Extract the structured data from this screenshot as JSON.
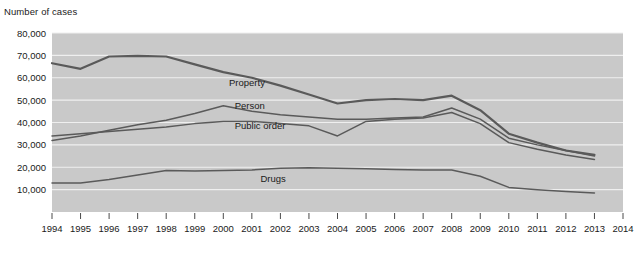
{
  "chart_data": {
    "type": "line",
    "title": "Number of cases",
    "xlabel": "",
    "ylabel": "Number of cases",
    "grid": true,
    "legend": "inline-labels",
    "ylim": [
      0,
      80000
    ],
    "yticks": [
      10000,
      20000,
      30000,
      40000,
      50000,
      60000,
      70000,
      80000
    ],
    "ytick_labels": [
      "10,000",
      "20,000",
      "30,000",
      "40,000",
      "50,000",
      "60,000",
      "70,000",
      "80,000"
    ],
    "xlim": [
      1994,
      2014
    ],
    "x": [
      1994,
      1995,
      1996,
      1997,
      1998,
      1999,
      2000,
      2001,
      2002,
      2003,
      2004,
      2005,
      2006,
      2007,
      2008,
      2009,
      2010,
      2011,
      2012,
      2013
    ],
    "xtick_labels": [
      "1994",
      "1995",
      "1996",
      "1997",
      "1998",
      "1999",
      "2000",
      "2001",
      "2002",
      "2003",
      "2004",
      "2005",
      "2006",
      "2007",
      "2008",
      "2009",
      "2010",
      "2011",
      "2012",
      "2013",
      "2014"
    ],
    "xticks": [
      1994,
      1995,
      1996,
      1997,
      1998,
      1999,
      2000,
      2001,
      2002,
      2003,
      2004,
      2005,
      2006,
      2007,
      2008,
      2009,
      2010,
      2011,
      2012,
      2013,
      2014
    ],
    "series": [
      {
        "name": "Property",
        "label": "Property",
        "color": "#5a5a5a",
        "width": 2.2,
        "label_x": 2000.2,
        "label_y": 56500,
        "values": [
          66500,
          64000,
          69500,
          69800,
          69500,
          66000,
          62500,
          60000,
          56500,
          52500,
          48500,
          50000,
          50500,
          50000,
          52000,
          45500,
          35000,
          31000,
          27500,
          25500
        ]
      },
      {
        "name": "Person",
        "label": "Person",
        "color": "#5a5a5a",
        "width": 1.5,
        "label_x": 2000.4,
        "label_y": 46000,
        "values": [
          32000,
          34000,
          36500,
          39000,
          41000,
          44000,
          47500,
          45000,
          43500,
          42500,
          41500,
          41500,
          42000,
          42500,
          46500,
          41500,
          33000,
          30000,
          27500,
          25000
        ]
      },
      {
        "name": "Public order",
        "label": "Public order",
        "color": "#5a5a5a",
        "width": 1.5,
        "label_x": 2000.4,
        "label_y": 37000,
        "values": [
          34000,
          35000,
          36000,
          37000,
          38000,
          39500,
          40500,
          40500,
          39500,
          38500,
          34000,
          40500,
          41500,
          42000,
          44500,
          39500,
          31000,
          28000,
          25500,
          23500
        ]
      },
      {
        "name": "Drugs",
        "label": "Drugs",
        "color": "#5a5a5a",
        "width": 1.5,
        "label_x": 2001.3,
        "label_y": 13500,
        "values": [
          13000,
          13000,
          14500,
          16500,
          18500,
          18300,
          18500,
          18800,
          19500,
          19800,
          19500,
          19300,
          19000,
          18800,
          18800,
          16000,
          11000,
          10000,
          9200,
          8500
        ]
      }
    ]
  }
}
